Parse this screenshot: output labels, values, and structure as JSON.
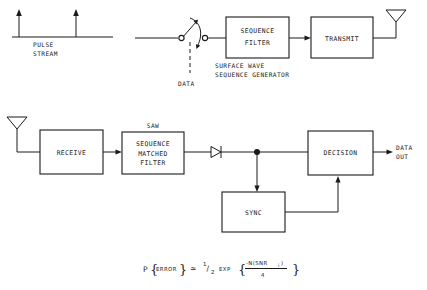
{
  "diagram": {
    "ink_color": "#1a1a1a",
    "background_color": "#ffffff"
  },
  "transmitter": {
    "pulse_stream_label_line1": "PULSE",
    "pulse_stream_label_line2": "STREAM",
    "data_label": "DATA",
    "sequence_filter_line1": "SEQUENCE",
    "sequence_filter_line2": "FILTER",
    "caption_line1": "SURFACE WAVE",
    "caption_line2": "SEQUENCE GENERATOR",
    "transmit_label": "TRANSMIT"
  },
  "receiver": {
    "receive_label": "RECEIVE",
    "saw_label": "SAW",
    "matched_filter_line1": "SEQUENCE",
    "matched_filter_line2": "MATCHED",
    "matched_filter_line3": "FILTER",
    "decision_label": "DECISION",
    "sync_label": "SYNC",
    "data_out_line1": "DATA",
    "data_out_line2": "OUT"
  },
  "equation": {
    "p_symbol": "P",
    "brace_open": "{",
    "error_text": "ERROR",
    "brace_close": "}",
    "approx": "≃",
    "one": "1",
    "slash": "/",
    "two": "2",
    "exp": "EXP",
    "numerator": "-N(SNR",
    "numerator_sub": "i",
    "numerator_end": ")",
    "denominator": "4",
    "full_text": "P {ERROR} ≃ 1/2 EXP { -N(SNRi) / 4 }"
  },
  "icons": {
    "antenna_transmit": "antenna-icon",
    "antenna_receive": "antenna-icon",
    "switch": "toggle-switch-icon",
    "diode": "diode-icon",
    "junction": "junction-dot-icon"
  }
}
